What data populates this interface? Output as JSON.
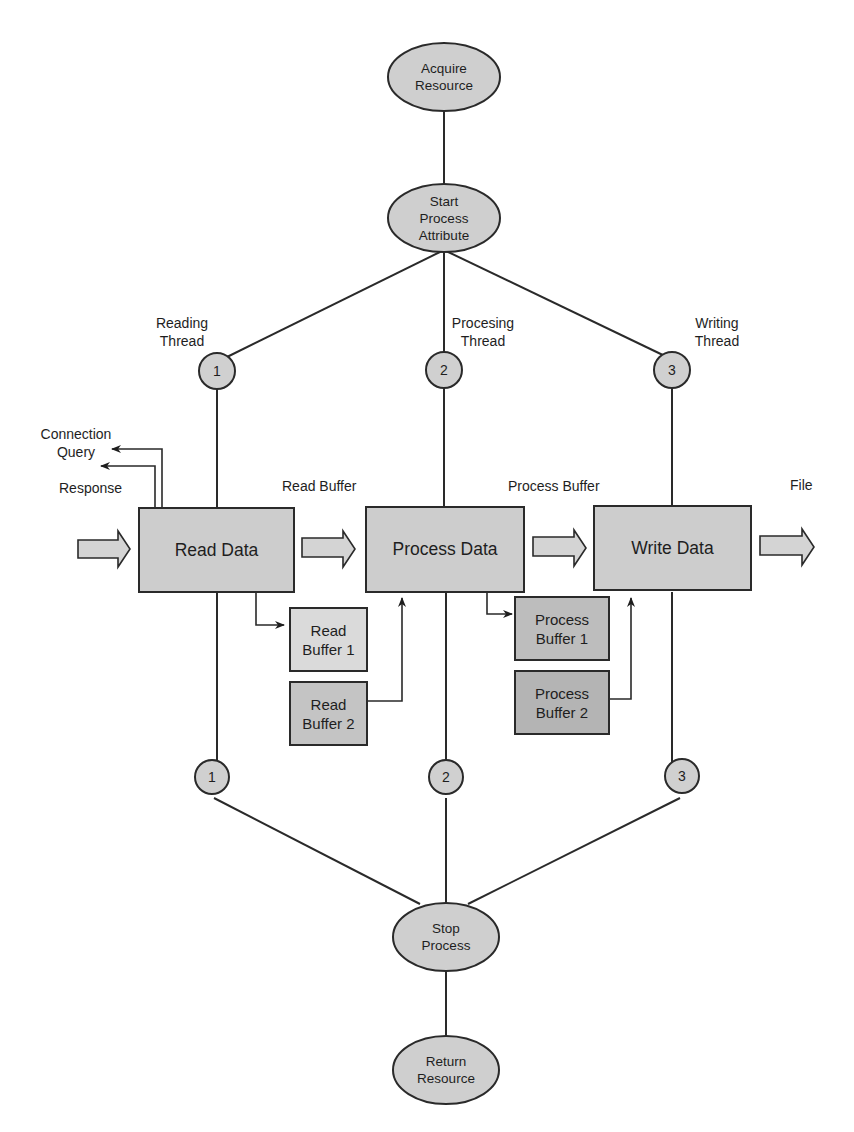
{
  "diagram": {
    "title": "",
    "colors": {
      "line": "#2a2a2a",
      "node_fill": "#cfcfcf",
      "box_fill": "#cdcdcd",
      "buffer_light_fill": "#dadada",
      "buffer_mid_fill": "#c4c4c4",
      "buffer_dark_fill": "#b4b4b4",
      "arrow_fill": "#d4d4d4"
    },
    "nodes": {
      "acquire_resource": {
        "line1": "Acquire",
        "line2": "Resource"
      },
      "start_process": {
        "line1": "Start",
        "line2": "Process",
        "line3": "Attribute"
      },
      "stop_process": {
        "line1": "Stop",
        "line2": "Process"
      },
      "return_resource": {
        "line1": "Return",
        "line2": "Resource"
      }
    },
    "threads": [
      {
        "number": "1",
        "label_line1": "Reading",
        "label_line2": "Thread"
      },
      {
        "number": "2",
        "label_line1": "Procesing",
        "label_line2": "Thread"
      },
      {
        "number": "3",
        "label_line1": "Writing",
        "label_line2": "Thread"
      }
    ],
    "join_points": [
      "1",
      "2",
      "3"
    ],
    "stages": [
      {
        "label": "Read Data"
      },
      {
        "label": "Process Data"
      },
      {
        "label": "Write Data"
      }
    ],
    "flow_labels": {
      "read_buffer": "Read Buffer",
      "process_buffer": "Process Buffer",
      "file": "File"
    },
    "side_outputs": {
      "connection_query_line1": "Connection",
      "connection_query_line2": "Query",
      "response": "Response"
    },
    "buffers": [
      {
        "line1": "Read",
        "line2": "Buffer 1"
      },
      {
        "line1": "Read",
        "line2": "Buffer 2"
      },
      {
        "line1": "Process",
        "line2": "Buffer 1"
      },
      {
        "line1": "Process",
        "line2": "Buffer 2"
      }
    ]
  }
}
